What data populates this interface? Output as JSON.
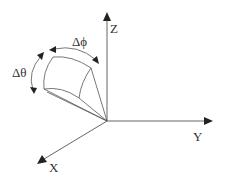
{
  "diagram": {
    "title": "",
    "type": "3D coordinate system with spherical surface patch",
    "axes": {
      "z": {
        "label": "Z"
      },
      "y": {
        "label": "Y"
      },
      "x": {
        "label": "X"
      }
    },
    "annotations": {
      "delta_phi": {
        "label": "Δϕ"
      },
      "delta_theta": {
        "label": "Δθ"
      }
    },
    "colors": {
      "line": "#555555",
      "arrowhead": "#222222",
      "text": "#333333",
      "background": "#ffffff"
    }
  }
}
